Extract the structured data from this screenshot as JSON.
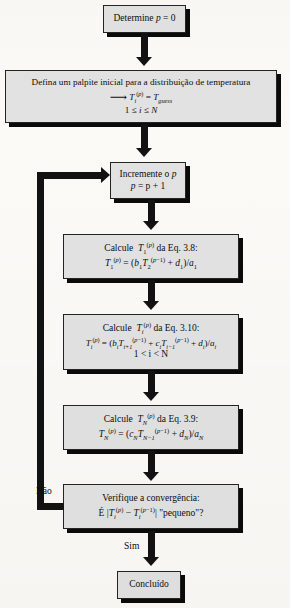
{
  "diagram": {
    "colors": {
      "box_fill": "#e2e2e2",
      "box_border": "#242424",
      "shadow": "#0a0a0a",
      "connector": "#121212",
      "page_background": "#fbfaf7"
    },
    "nodes": [
      {
        "id": "determine-p",
        "name": "determine-p-box",
        "lines": [
          {
            "type": "math",
            "text": "Determine p = 0"
          }
        ]
      },
      {
        "id": "initial-guess",
        "name": "initial-guess-box",
        "lines": [
          {
            "type": "text",
            "text": "Defina um palpite inicial para a distribuição de temperatura"
          },
          {
            "type": "math",
            "text": "→ Ti(p) = Tguess"
          },
          {
            "type": "math",
            "text": "1 ≤ i ≤ N"
          }
        ]
      },
      {
        "id": "increment-p",
        "name": "increment-p-box",
        "lines": [
          {
            "type": "math",
            "text": "Incremente o p"
          },
          {
            "type": "math",
            "text": "p = p + 1"
          }
        ]
      },
      {
        "id": "calc-t1",
        "name": "calculate-t1-box",
        "lines": [
          {
            "type": "math",
            "text": "Calcule T1(p) da Eq. 3.8:"
          },
          {
            "type": "math",
            "text": "T1(p) = (b1 T2(p-1) + d1)/a1"
          }
        ]
      },
      {
        "id": "calc-ti",
        "name": "calculate-ti-box",
        "lines": [
          {
            "type": "math",
            "text": "Calcule Ti(p) da Eq. 3.10:"
          },
          {
            "type": "math",
            "text": "Ti(p) = (bi Ti+1(p-1) + ci Ti-1(p-1) + di)/ai"
          },
          {
            "type": "math",
            "text": "1 < i < N"
          }
        ]
      },
      {
        "id": "calc-tn",
        "name": "calculate-tn-box",
        "lines": [
          {
            "type": "math",
            "text": "Calcule TN(p) da Eq. 3.9:"
          },
          {
            "type": "math",
            "text": "TN(p) = (cN TN-1(p-1) + dN)/aN"
          }
        ]
      },
      {
        "id": "check-convergence",
        "name": "check-convergence-box",
        "lines": [
          {
            "type": "text",
            "text": "Verifique a convergência:"
          },
          {
            "type": "math",
            "text": "É |Ti(p) - Ti(p-1)| \"pequeno\"?"
          }
        ]
      },
      {
        "id": "done",
        "name": "done-box",
        "lines": [
          {
            "type": "text",
            "text": "Concluído"
          }
        ]
      }
    ],
    "edge_labels": {
      "no": "Não",
      "yes": "Sim"
    },
    "text": {
      "determine": "Determine",
      "p_var": "p",
      "p_zero_eq": "= 0",
      "guess_line": "Defina um palpite inicial para a distribuição de temperatura",
      "t_guess_sub": "guess",
      "bounds_1": "1",
      "le1": "≤",
      "i_var": "i",
      "le2": "≤",
      "N_var": "N",
      "increment_label": "Incremente o",
      "p_increment_eq": "= p + 1",
      "calcule": "Calcule",
      "da_eq_38": "da Eq. 3.8:",
      "da_eq_310": "da Eq. 3.10:",
      "da_eq_39": "da Eq. 3.9:",
      "range_i": "1 < i < N",
      "verify": "Verifique a convergência:",
      "e_char": "É",
      "pequeno": "\"pequeno\"?",
      "concluido": "Concluído"
    }
  }
}
